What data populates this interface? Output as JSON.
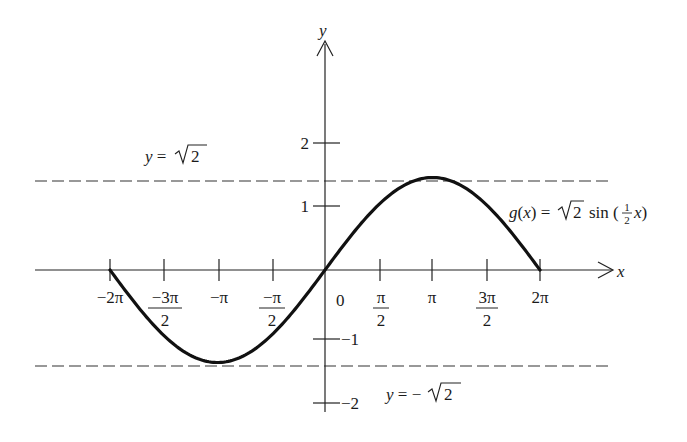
{
  "chart_data": {
    "type": "line",
    "title": "",
    "function_label": "g(x) = √2 sin (½x)",
    "xlabel": "x",
    "ylabel": "y",
    "xlim": [
      -6.283,
      6.283
    ],
    "ylim": [
      -2,
      2
    ],
    "x_ticks": [
      {
        "value": -6.2832,
        "label": "−2π"
      },
      {
        "value": -4.7124,
        "label_num": "−3π",
        "label_den": "2"
      },
      {
        "value": -3.1416,
        "label": "−π"
      },
      {
        "value": -1.5708,
        "label_num": "−π",
        "label_den": "2"
      },
      {
        "value": 0,
        "label": "0"
      },
      {
        "value": 1.5708,
        "label_num": "π",
        "label_den": "2"
      },
      {
        "value": 3.1416,
        "label": "π"
      },
      {
        "value": 4.7124,
        "label_num": "3π",
        "label_den": "2"
      },
      {
        "value": 6.2832,
        "label": "2π"
      }
    ],
    "y_ticks": [
      {
        "value": 2,
        "label": "2"
      },
      {
        "value": 1,
        "label": "1"
      },
      {
        "value": -1,
        "label": "−1"
      },
      {
        "value": -2,
        "label": "−2"
      }
    ],
    "series": [
      {
        "name": "g(x) = √2 sin(x/2)",
        "x": [
          -6.2832,
          -4.7124,
          -3.1416,
          -1.5708,
          0,
          1.5708,
          3.1416,
          4.7124,
          6.2832
        ],
        "y": [
          0,
          -1.0,
          -1.4142,
          -1.0,
          0,
          1.0,
          1.4142,
          1.0,
          0
        ]
      }
    ],
    "asymptotes": [
      {
        "y": 1.4142,
        "label": "y = √2",
        "style": "dashed"
      },
      {
        "y": -1.4142,
        "label": "y = −√2",
        "style": "dashed"
      }
    ],
    "grid": false,
    "legend": "none"
  },
  "labels": {
    "x_axis": "x",
    "y_axis": "y",
    "origin": "0",
    "upper_asymptote_lhs": "y = ",
    "upper_asymptote_rhs": "2",
    "lower_asymptote_lhs": "y = −",
    "lower_asymptote_rhs": "2",
    "function_lhs": "g(x) =",
    "function_root": "2",
    "function_sin": "sin (",
    "function_frac_num": "1",
    "function_frac_den": "2",
    "function_tail": "x)",
    "xt_m2pi": "−2π",
    "xt_m3pi2_num": "−3π",
    "xt_m3pi2_den": "2",
    "xt_mpi": "−π",
    "xt_mpi2_num": "−π",
    "xt_mpi2_den": "2",
    "xt_pi2_num": "π",
    "xt_pi2_den": "2",
    "xt_pi": "π",
    "xt_3pi2_num": "3π",
    "xt_3pi2_den": "2",
    "xt_2pi": "2π",
    "yt_2": "2",
    "yt_1": "1",
    "yt_m1": "−1",
    "yt_m2": "−2"
  }
}
